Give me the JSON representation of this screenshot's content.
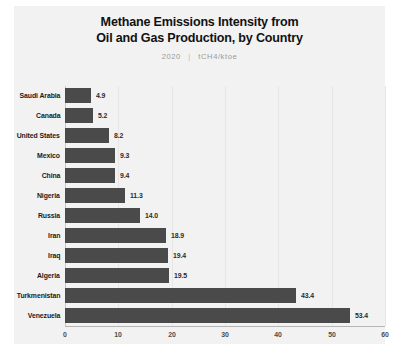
{
  "chart_data": {
    "type": "bar",
    "orientation": "horizontal",
    "title": "Methane Emissions Intensity from Oil and Gas Production, by Country",
    "title_lines": [
      "Methane Emissions Intensity from",
      "Oil and Gas Production, by Country"
    ],
    "subtitle_year": "2020",
    "subtitle_separator": "|",
    "subtitle_units": "tCH4/ktoe",
    "xlabel": "",
    "ylabel": "",
    "xlim": [
      0,
      60
    ],
    "xticks": [
      0,
      10,
      20,
      30,
      40,
      50,
      60
    ],
    "xtick_labels": [
      "0",
      "10",
      "20",
      "30",
      "40",
      "50",
      "60"
    ],
    "grid": true,
    "legend": "none",
    "bar_color": "#4a4a4a",
    "background_color": "#f2f2f2",
    "categories": [
      "Saudi Arabia",
      "Canada",
      "United States",
      "Mexico",
      "China",
      "Nigeria",
      "Russia",
      "Iran",
      "Iraq",
      "Algeria",
      "Turkmenistan",
      "Venezuela"
    ],
    "values": [
      4.9,
      5.2,
      8.2,
      9.3,
      9.4,
      11.3,
      14.0,
      18.9,
      19.4,
      19.5,
      43.4,
      53.4
    ],
    "value_labels": [
      "4.9",
      "5.2",
      "8.2",
      "9.3",
      "9.4",
      "11.3",
      "14.0",
      "18.9",
      "19.4",
      "19.5",
      "43.4",
      "53.4"
    ]
  }
}
